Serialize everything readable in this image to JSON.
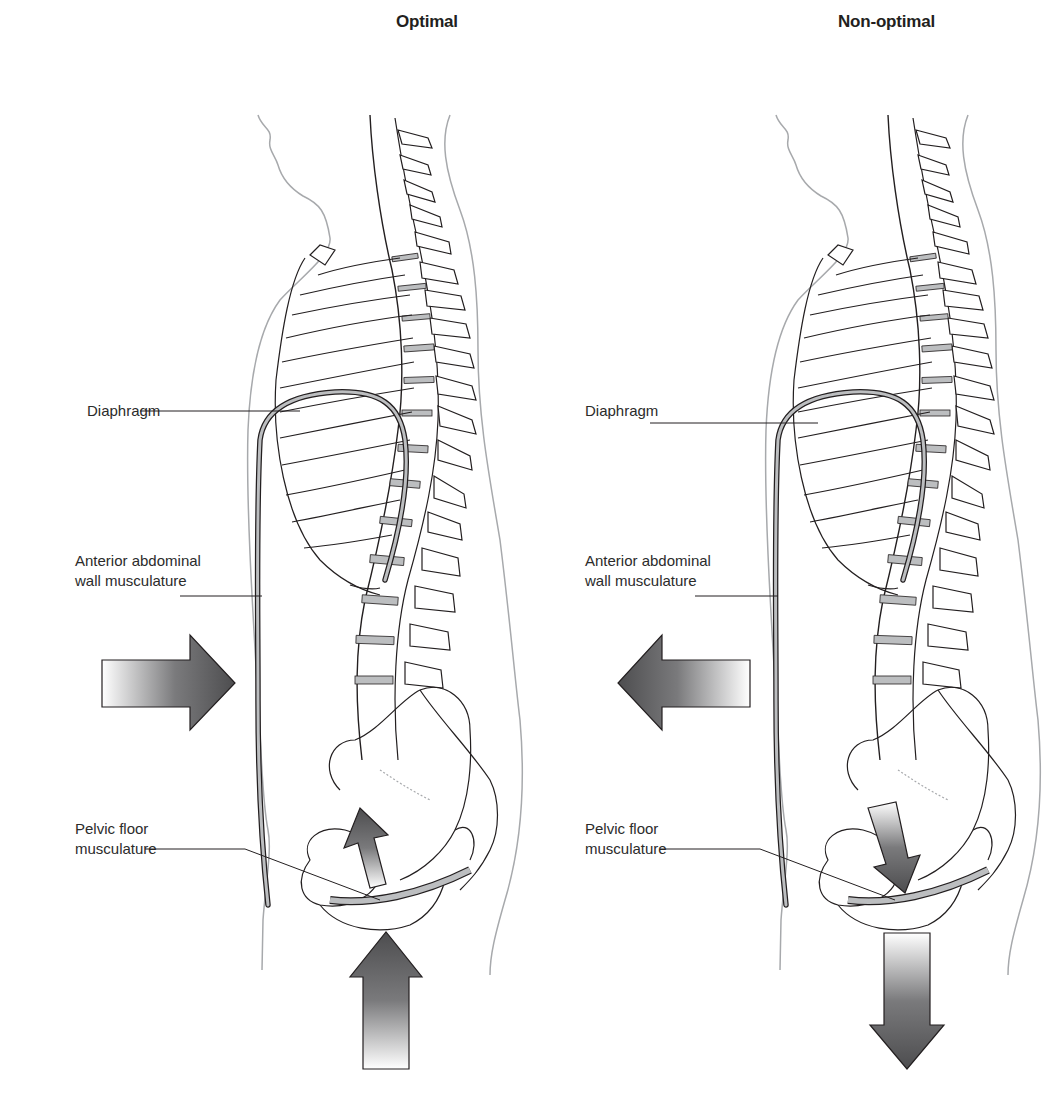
{
  "figure": {
    "panels": [
      {
        "id": "optimal",
        "title": "Optimal",
        "labels": {
          "diaphragm": "Diaphragm",
          "abdominal_line1": "Anterior abdominal",
          "abdominal_line2": "wall musculature",
          "pelvic_line1": "Pelvic floor",
          "pelvic_line2": "musculature"
        },
        "arrows": {
          "abdominal_direction": "inward (pointing right, toward body)",
          "pelvic_floor_direction": "upward",
          "external_direction": "upward (from below)"
        }
      },
      {
        "id": "non-optimal",
        "title": "Non-optimal",
        "labels": {
          "diaphragm": "Diaphragm",
          "abdominal_line1": "Anterior abdominal",
          "abdominal_line2": "wall musculature",
          "pelvic_line1": "Pelvic floor",
          "pelvic_line2": "musculature"
        },
        "arrows": {
          "abdominal_direction": "outward (pointing left, away from body)",
          "pelvic_floor_direction": "downward",
          "external_direction": "downward"
        }
      }
    ],
    "colors": {
      "outline": "#231f20",
      "body_outline": "#a7a9ac",
      "muscle_fill": "#bcbec0",
      "arrow_dark": "#4d4d4f",
      "arrow_light": "#ffffff"
    }
  }
}
